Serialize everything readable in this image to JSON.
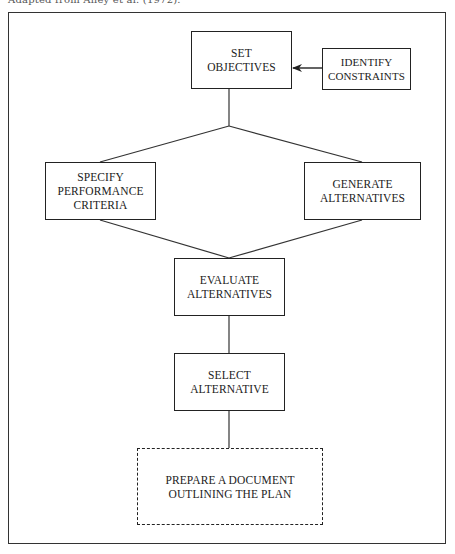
{
  "caption": "Adapted from Alley et al. (1972).",
  "diagram": {
    "type": "flowchart",
    "nodes": [
      {
        "id": "set_objectives",
        "lines": [
          "SET",
          "OBJECTIVES"
        ],
        "style": "solid"
      },
      {
        "id": "identify_constraints",
        "lines": [
          "IDENTIFY",
          "CONSTRAINTS"
        ],
        "style": "solid"
      },
      {
        "id": "specify_performance_criteria",
        "lines": [
          "SPECIFY",
          "PERFORMANCE",
          "CRITERIA"
        ],
        "style": "solid"
      },
      {
        "id": "generate_alternatives",
        "lines": [
          "GENERATE",
          "ALTERNATIVES"
        ],
        "style": "solid"
      },
      {
        "id": "evaluate_alternatives",
        "lines": [
          "EVALUATE",
          "ALTERNATIVES"
        ],
        "style": "solid"
      },
      {
        "id": "select_alternative",
        "lines": [
          "SELECT",
          "ALTERNATIVE"
        ],
        "style": "solid"
      },
      {
        "id": "prepare_document",
        "lines": [
          "PREPARE A DOCUMENT",
          "OUTLINING THE PLAN"
        ],
        "style": "dashed"
      }
    ],
    "edges": [
      {
        "from": "identify_constraints",
        "to": "set_objectives",
        "arrow": true
      },
      {
        "from": "set_objectives",
        "to": "specify_performance_criteria",
        "arrow": false
      },
      {
        "from": "set_objectives",
        "to": "generate_alternatives",
        "arrow": false
      },
      {
        "from": "specify_performance_criteria",
        "to": "evaluate_alternatives",
        "arrow": false
      },
      {
        "from": "generate_alternatives",
        "to": "evaluate_alternatives",
        "arrow": false
      },
      {
        "from": "evaluate_alternatives",
        "to": "select_alternative",
        "arrow": false
      },
      {
        "from": "select_alternative",
        "to": "prepare_document",
        "arrow": false
      }
    ]
  }
}
